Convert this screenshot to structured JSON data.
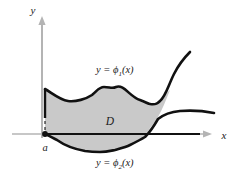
{
  "figure": {
    "background_color": "#ffffff",
    "region_fill_color": "#c9c9c9",
    "curve_color": "#111111",
    "axis_color": "#b0b0b0",
    "axis_dark_color": "#111111"
  },
  "axes": {
    "y_axis_label": "y",
    "x_axis_label": "x",
    "origin_x": 42,
    "origin_y": 134
  },
  "labels": {
    "upper_curve": {
      "lhs": "y",
      "equals": "=",
      "fn": "ϕ",
      "subscript": "1",
      "arg": "(x)"
    },
    "lower_curve": {
      "lhs": "y",
      "equals": "=",
      "fn": "ϕ",
      "subscript": "2",
      "arg": "(x)"
    },
    "region": "D",
    "left_endpoint": "a"
  },
  "chart_data": {
    "type": "area",
    "title": "",
    "xlabel": "x",
    "ylabel": "y",
    "grid": false,
    "legend": "none",
    "annotations": [
      {
        "text": "y = ϕ1(x)",
        "role": "upper-boundary-label",
        "x_px": 122,
        "y_px": 70
      },
      {
        "text": "y = ϕ2(x)",
        "role": "lower-boundary-label",
        "x_px": 122,
        "y_px": 160
      },
      {
        "text": "D",
        "role": "region-label",
        "x_px": 110,
        "y_px": 120
      },
      {
        "text": "a",
        "role": "left-endpoint-label",
        "x_px": 46,
        "y_px": 148
      }
    ],
    "series": [
      {
        "name": "y = ϕ1(x)",
        "role": "upper-boundary",
        "points_px": [
          [
            45,
            89
          ],
          [
            56,
            95
          ],
          [
            68,
            101
          ],
          [
            80,
            101
          ],
          [
            92,
            95
          ],
          [
            104,
            87
          ],
          [
            116,
            87
          ],
          [
            128,
            93
          ],
          [
            140,
            100
          ],
          [
            150,
            104
          ],
          [
            160,
            101
          ],
          [
            170,
            90
          ],
          [
            180,
            75
          ],
          [
            190,
            62
          ]
        ]
      },
      {
        "name": "y = ϕ2(x)",
        "role": "lower-boundary",
        "points_px": [
          [
            45,
            134
          ],
          [
            57,
            140
          ],
          [
            70,
            147
          ],
          [
            85,
            151
          ],
          [
            100,
            152
          ],
          [
            115,
            150
          ],
          [
            130,
            145
          ],
          [
            145,
            137
          ],
          [
            158,
            127
          ],
          [
            172,
            119
          ],
          [
            186,
            115
          ],
          [
            200,
            113
          ],
          [
            212,
            113
          ]
        ]
      },
      {
        "name": "left edge x = a",
        "role": "left-boundary",
        "points_px": [
          [
            45,
            89
          ],
          [
            45,
            134
          ]
        ]
      }
    ]
  }
}
